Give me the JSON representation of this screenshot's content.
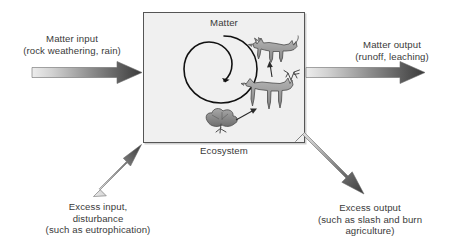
{
  "diagram": {
    "box": {
      "inner_label": "Matter",
      "caption": "Ecosystem",
      "fill_color": "#f0f0f0",
      "border_color": "#555555"
    },
    "labels": {
      "matter_input": "Matter input\n(rock weathering, rain)",
      "matter_output": "Matter output\n(runoff, leaching)",
      "excess_input": "Excess input,\ndisturbance\n(such as eutrophication)",
      "excess_output": "Excess output\n(such as slash and burn\nagriculture)"
    },
    "arrows": [
      {
        "name": "matter-input-arrow",
        "direction": "right",
        "from": "left margin",
        "to": "ecosystem box left edge",
        "gradient_from": "#e8e8e8",
        "gradient_to": "#3c3c3c"
      },
      {
        "name": "matter-output-arrow",
        "direction": "right",
        "from": "ecosystem box right edge",
        "to": "right margin",
        "gradient_from": "#e8e8e8",
        "gradient_to": "#3c3c3c"
      },
      {
        "name": "excess-input-arrow",
        "direction": "up-right",
        "from": "lower left",
        "to": "ecosystem box lower left corner",
        "gradient_from": "#e8e8e8",
        "gradient_to": "#3c3c3c"
      },
      {
        "name": "excess-output-arrow",
        "direction": "down-right",
        "from": "ecosystem box lower right corner",
        "to": "lower right",
        "gradient_from": "#e8e8e8",
        "gradient_to": "#3c3c3c"
      }
    ],
    "cycle": {
      "name": "matter-cycle-spiral",
      "description": "Spiral arrow representing matter cycling within the ecosystem",
      "stroke_color": "#1a1a1a"
    },
    "food_chain": {
      "description": "Trophic transfer arrows from shrub to herbivore to carnivore",
      "organisms": [
        {
          "name": "wolf",
          "role": "carnivore"
        },
        {
          "name": "elk",
          "role": "herbivore"
        },
        {
          "name": "shrub",
          "role": "producer"
        }
      ],
      "arrows": [
        {
          "from": "shrub",
          "to": "elk"
        },
        {
          "from": "elk",
          "to": "wolf"
        }
      ]
    },
    "colors": {
      "background": "#ffffff",
      "text": "#3a3a3a",
      "animal_fill": "#9a9a9a",
      "animal_stroke": "#4a4a4a"
    }
  }
}
